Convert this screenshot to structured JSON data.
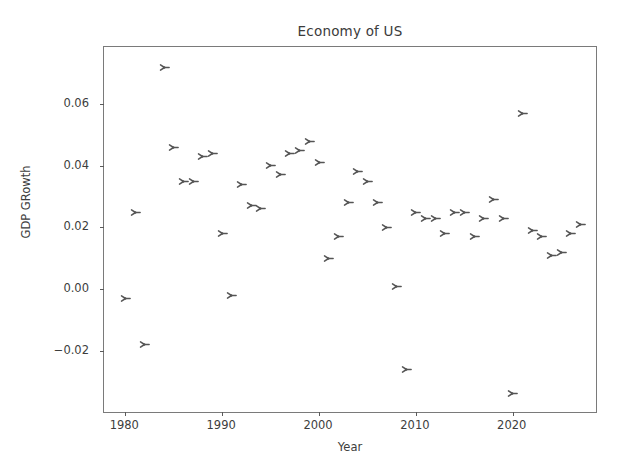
{
  "chart_data": {
    "type": "scatter",
    "title": "Economy of US",
    "xlabel": "Year",
    "ylabel": "GDP GRowth",
    "xlim": [
      1977.8,
      2028.8
    ],
    "ylim": [
      -0.0405,
      0.0785
    ],
    "xticks": [
      1980,
      1990,
      2000,
      2010,
      2020
    ],
    "xticklabels": [
      "1980",
      "1990",
      "2000",
      "2010",
      "2020"
    ],
    "yticks": [
      -0.02,
      0.0,
      0.02,
      0.04,
      0.06
    ],
    "yticklabels": [
      "-0.02",
      "0.00",
      "0.02",
      "0.04",
      "0.06"
    ],
    "grid": false,
    "legend": null,
    "marker": "tri_right",
    "marker_color": "#555555",
    "series": [
      {
        "name": "GDP Growth",
        "x": [
          1980,
          1981,
          1982,
          1984,
          1985,
          1986,
          1987,
          1988,
          1989,
          1990,
          1991,
          1992,
          1993,
          1994,
          1995,
          1996,
          1997,
          1998,
          1999,
          2000,
          2001,
          2002,
          2003,
          2004,
          2005,
          2006,
          2007,
          2008,
          2009,
          2010,
          2011,
          2012,
          2013,
          2014,
          2015,
          2016,
          2017,
          2018,
          2019,
          2020,
          2021,
          2022,
          2023,
          2024,
          2025,
          2026,
          2027
        ],
        "y": [
          -0.003,
          0.025,
          -0.018,
          0.072,
          0.046,
          0.035,
          0.035,
          0.043,
          0.044,
          0.018,
          -0.002,
          0.034,
          0.027,
          0.026,
          0.04,
          0.037,
          0.044,
          0.045,
          0.048,
          0.041,
          0.01,
          0.017,
          0.028,
          0.038,
          0.035,
          0.028,
          0.02,
          0.001,
          -0.026,
          0.025,
          0.023,
          0.023,
          0.018,
          0.025,
          0.025,
          0.017,
          0.023,
          0.029,
          0.023,
          -0.034,
          0.057,
          0.019,
          0.017,
          0.011,
          0.012,
          0.018,
          0.021
        ]
      }
    ]
  },
  "figure": {
    "background": "#ffffff",
    "axes_color": "#7a7a7a",
    "text_color": "#3d3d3d"
  }
}
